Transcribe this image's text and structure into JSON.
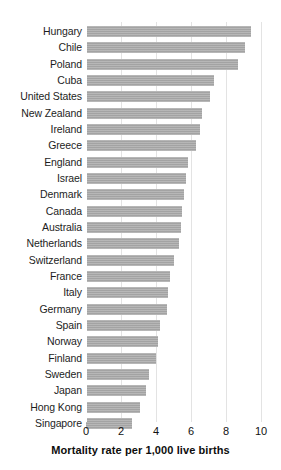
{
  "chart_data": {
    "type": "bar",
    "orientation": "horizontal",
    "title": "",
    "xlabel": "Mortality rate per 1,000 live births",
    "ylabel": "",
    "xlim": [
      0,
      10
    ],
    "xticks": [
      0,
      2,
      4,
      6,
      8,
      10
    ],
    "xtick_labels": [
      "0",
      "2",
      "4",
      "6",
      "8",
      "10"
    ],
    "grid": "vertical",
    "legend": "none",
    "bar_color": "#a9a9a9",
    "categories": [
      "Hungary",
      "Chile",
      "Poland",
      "Cuba",
      "United States",
      "New Zealand",
      "Ireland",
      "Greece",
      "England",
      "Israel",
      "Denmark",
      "Canada",
      "Australia",
      "Netherlands",
      "Switzerland",
      "France",
      "Italy",
      "Germany",
      "Spain",
      "Norway",
      "Finland",
      "Sweden",
      "Japan",
      "Hong Kong",
      "Singapore"
    ],
    "values": [
      9.4,
      9.1,
      8.7,
      7.3,
      7.1,
      6.6,
      6.5,
      6.3,
      5.8,
      5.7,
      5.6,
      5.5,
      5.4,
      5.3,
      5.0,
      4.8,
      4.7,
      4.6,
      4.2,
      4.1,
      4.0,
      3.6,
      3.4,
      3.1,
      2.6
    ]
  }
}
